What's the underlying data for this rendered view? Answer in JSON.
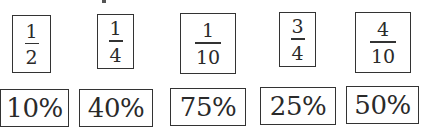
{
  "fractions": [
    {
      "numerator": "1",
      "denominator": "2"
    },
    {
      "numerator": "1",
      "denominator": "4"
    },
    {
      "numerator": "1",
      "denominator": "10"
    },
    {
      "numerator": "3",
      "denominator": "4"
    },
    {
      "numerator": "4",
      "denominator": "10"
    }
  ],
  "percents": [
    {
      "label": "10%"
    },
    {
      "label": "40%"
    },
    {
      "label": "75%"
    },
    {
      "label": "25%"
    },
    {
      "label": "50%"
    }
  ],
  "colors": {
    "border": "#333333",
    "text": "#2a2a2a",
    "background": "#ffffff"
  }
}
